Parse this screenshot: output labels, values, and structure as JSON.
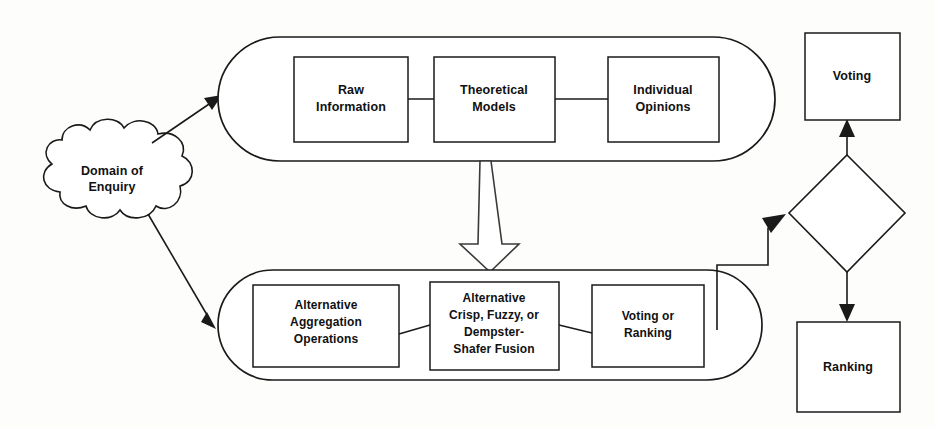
{
  "diagram": {
    "colors": {
      "stroke": "#1a1a1a",
      "fill": "#ffffff",
      "background": "#fdfdfc",
      "text": "#111111"
    },
    "source_node": {
      "id": "domain-of-enquiry",
      "shape": "cloud",
      "label_line1": "Domain of",
      "label_line2": "Enquiry"
    },
    "groups": [
      {
        "id": "information-group",
        "shape": "capsule",
        "nodes": [
          {
            "id": "raw-information",
            "label_line1": "Raw",
            "label_line2": "Information"
          },
          {
            "id": "theoretical-models",
            "label_line1": "Theoretical",
            "label_line2": "Models"
          },
          {
            "id": "individual-opinions",
            "label_line1": "Individual",
            "label_line2": "Opinions"
          }
        ]
      },
      {
        "id": "fusion-group",
        "shape": "capsule",
        "nodes": [
          {
            "id": "alternative-aggregation-operations",
            "label_line1": "Alternative",
            "label_line2": "Aggregation",
            "label_line3": "Operations"
          },
          {
            "id": "alternative-fusion",
            "label_line1": "Alternative",
            "label_line2": "Crisp, Fuzzy, or",
            "label_line3": "Dempster-",
            "label_line4": "Shafer Fusion"
          },
          {
            "id": "voting-or-ranking",
            "label_line1": "Voting or",
            "label_line2": "Ranking"
          }
        ]
      }
    ],
    "outcome_nodes": [
      {
        "id": "voting",
        "shape": "rectangle",
        "label": "Voting"
      },
      {
        "id": "decision-diamond",
        "shape": "diamond",
        "label": ""
      },
      {
        "id": "ranking",
        "shape": "rectangle",
        "label": "Ranking"
      }
    ],
    "connectors": [
      {
        "id": "domain-to-information",
        "type": "arrow"
      },
      {
        "id": "domain-to-fusion",
        "type": "arrow"
      },
      {
        "id": "information-to-fusion",
        "type": "block-arrow"
      },
      {
        "id": "raw-to-theoretical",
        "type": "line"
      },
      {
        "id": "theoretical-to-opinions",
        "type": "line"
      },
      {
        "id": "aggregation-to-fusion",
        "type": "line"
      },
      {
        "id": "fusion-to-votingranking",
        "type": "line"
      },
      {
        "id": "fusion-group-to-diamond",
        "type": "stepped-arrow"
      },
      {
        "id": "diamond-to-voting",
        "type": "arrow"
      },
      {
        "id": "diamond-to-ranking",
        "type": "arrow"
      }
    ]
  }
}
